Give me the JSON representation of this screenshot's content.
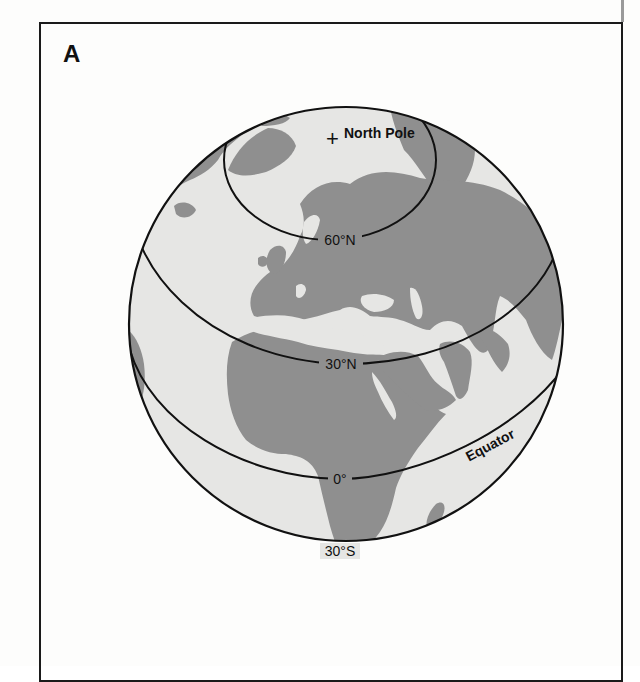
{
  "figure": {
    "panel_label": "A",
    "colors": {
      "ocean": "#e6e6e4",
      "land": "#8f8f8f",
      "lines": "#111111",
      "background": "#fdfdfc"
    }
  },
  "globe": {
    "pole_marker": "+",
    "pole_label": "North Pole",
    "latitudes": [
      {
        "id": "lat-60n",
        "label": "60°N"
      },
      {
        "id": "lat-30n",
        "label": "30°N"
      },
      {
        "id": "lat-0",
        "label": "0°"
      },
      {
        "id": "lat-30s",
        "label": "30°S"
      }
    ],
    "equator_label": "Equator"
  }
}
